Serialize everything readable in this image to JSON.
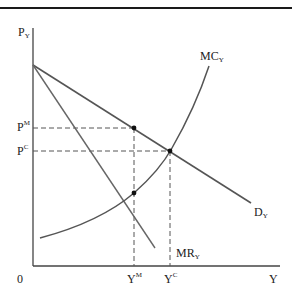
{
  "figure": {
    "type": "monopoly vs competition diagram",
    "axes": {
      "y_label": {
        "base": "P",
        "sub": "Y"
      },
      "x_label": "Y",
      "origin": "0"
    },
    "curves": {
      "mc": {
        "base": "MC",
        "sub": "Y"
      },
      "demand": {
        "base": "D",
        "sub": "Y"
      },
      "mr": {
        "base": "MR",
        "sub": "Y"
      }
    },
    "price_labels": {
      "pm": {
        "base": "P",
        "sup": "M"
      },
      "pc": {
        "base": "P",
        "sup": "C"
      }
    },
    "quantity_labels": {
      "ym": {
        "base": "Y",
        "sup": "M"
      },
      "yc": {
        "base": "Y",
        "sup": "C"
      }
    },
    "colors": {
      "line": "#555555",
      "axis": "#444444",
      "dot": "#111111"
    }
  }
}
